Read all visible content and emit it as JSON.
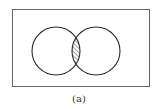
{
  "diagram": {
    "type": "venn",
    "sets": 2,
    "shaded_region": "intersection",
    "shading": "diagonal hatch",
    "colors": {
      "stroke": "#2a2a2a",
      "frame": "#555555",
      "background": "#ffffff"
    }
  },
  "caption": "(a)"
}
